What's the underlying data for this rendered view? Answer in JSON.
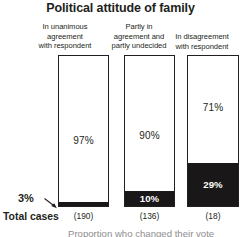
{
  "chart_data": {
    "type": "bar",
    "subtype": "100% stacked bar",
    "title": "Political attitude of family",
    "xlabel": "",
    "ylabel": "",
    "ylim": [
      0,
      100
    ],
    "grid": false,
    "legend_position": "none",
    "categories": [
      "In unanimous agreement with respondent",
      "Partly in agreement and partly undecided",
      "In disagreement with respondent"
    ],
    "category_lines": [
      [
        "In unanimous",
        "agreement",
        "with respondent"
      ],
      [
        "Partly in",
        "agreement and",
        "partly undecided"
      ],
      [
        "In disagreement",
        "with respondent"
      ]
    ],
    "series": [
      {
        "name": "white-segment",
        "color": "#ffffff",
        "values": [
          97,
          90,
          71
        ],
        "labels": [
          "97%",
          "90%",
          "71%"
        ]
      },
      {
        "name": "black-segment",
        "color": "#1a1718",
        "values": [
          3,
          10,
          29
        ],
        "labels": [
          "3%",
          "10%",
          "29%"
        ]
      }
    ],
    "totals_label": "Total cases",
    "totals": [
      190,
      136,
      18
    ],
    "totals_labels": [
      "(190)",
      "(136)",
      "(18)"
    ],
    "annotations": [
      {
        "name": "callout-3-percent",
        "text": "3%",
        "points_to": "bar-0 black segment"
      }
    ],
    "footnote": "Proportion who changed their vote"
  },
  "chart": {
    "title": "Political attitude of family",
    "columns": [
      {
        "header_line_1": "In unanimous",
        "header_line_2": "agreement",
        "header_line_3": "with respondent",
        "white_label": "97%",
        "black_label": "3%",
        "white_pct": 97,
        "black_pct": 3,
        "count_label": "(190)"
      },
      {
        "header_line_1": "Partly in",
        "header_line_2": "agreement and",
        "header_line_3": "partly undecided",
        "white_label": "90%",
        "black_label": "10%",
        "white_pct": 90,
        "black_pct": 10,
        "count_label": "(136)"
      },
      {
        "header_line_1": "In disagreement",
        "header_line_2": "with respondent",
        "header_line_3": "",
        "white_label": "71%",
        "black_label": "29%",
        "white_pct": 71,
        "black_pct": 29,
        "count_label": "(18)"
      }
    ],
    "callout": "3%",
    "total_cases_label": "Total cases",
    "footnote": "Proportion who changed their vote",
    "colors": {
      "ink": "#231f20",
      "segment_dark": "#1a1718",
      "segment_light": "#ffffff",
      "background": "#ffffff"
    }
  }
}
